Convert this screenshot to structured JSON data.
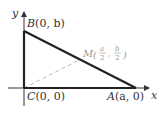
{
  "diagram": {
    "title": "",
    "axes": {
      "x_label": "x",
      "y_label": "y"
    },
    "points": {
      "B": {
        "name": "B",
        "coords": "(0, b)"
      },
      "C": {
        "name": "C",
        "coords": "(0, 0)"
      },
      "A": {
        "name": "A",
        "coords": "(a, 0)"
      },
      "M": {
        "name": "M",
        "x_num": "a",
        "y_num": "b",
        "den": "2"
      }
    },
    "colors": {
      "triangle": "#222222",
      "axes": "#333333",
      "median": "#bbbbbb",
      "m_label": "#9a9a9a"
    },
    "labels": {
      "B_text": "B(0, b)",
      "C_text": "C(0, 0)",
      "A_text": "A(a, 0)",
      "M_text": "M"
    }
  }
}
